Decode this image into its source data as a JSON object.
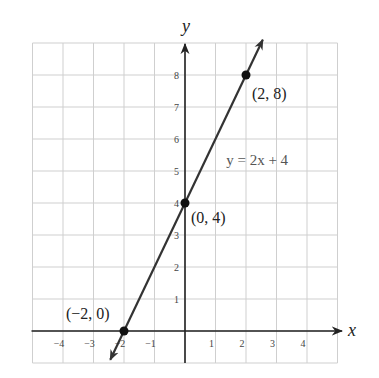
{
  "chart_data": {
    "type": "line",
    "title": "",
    "xlabel": "x",
    "ylabel": "y",
    "xlim": [
      -5,
      5
    ],
    "ylim": [
      -1,
      9
    ],
    "grid": true,
    "x_ticks": [
      -4,
      -3,
      -2,
      -1,
      1,
      2,
      3,
      4
    ],
    "x_tick_labels": [
      "−4",
      "−3",
      "−2",
      "−1",
      "1",
      "2",
      "3",
      "4"
    ],
    "y_ticks": [
      1,
      2,
      3,
      4,
      5,
      6,
      7,
      8
    ],
    "y_tick_labels": [
      "1",
      "2",
      "3",
      "4",
      "5",
      "6",
      "7",
      "8"
    ],
    "series": [
      {
        "name": "y = 2x + 4",
        "equation": "y = 2x + 4",
        "slope": 2,
        "intercept": 4,
        "x_range": [
          -2.45,
          2.55
        ]
      }
    ],
    "points": [
      {
        "x": -2,
        "y": 0,
        "label": "(−2, 0)"
      },
      {
        "x": 0,
        "y": 4,
        "label": "(0, 4)"
      },
      {
        "x": 2,
        "y": 8,
        "label": "(2, 8)"
      }
    ],
    "annotations": [
      {
        "text": "y = 2x + 4",
        "x": 1.35,
        "y": 5.2
      }
    ]
  },
  "colors": {
    "grid": "#cfcfcf",
    "axis": "#222222",
    "line": "#333333",
    "point": "#111111"
  }
}
